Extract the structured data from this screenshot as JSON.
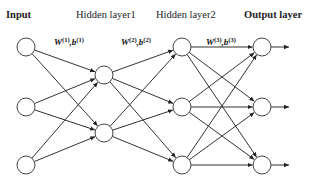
{
  "diagram": {
    "type": "feedforward-neural-network",
    "layers": [
      {
        "id": "input",
        "label": "Input",
        "bold": true,
        "x": 26,
        "nodes_y": [
          47,
          107,
          165
        ]
      },
      {
        "id": "hidden1",
        "label": "Hidden layer1",
        "bold": false,
        "x": 104,
        "nodes_y": [
          75,
          133
        ]
      },
      {
        "id": "hidden2",
        "label": "Hidden layer2",
        "bold": false,
        "x": 182,
        "nodes_y": [
          47,
          107,
          165
        ]
      },
      {
        "id": "output",
        "label": "Output layer",
        "bold": true,
        "x": 262,
        "nodes_y": [
          47,
          107,
          165
        ]
      }
    ],
    "weights": [
      {
        "W": "W",
        "sup_w": "(1)",
        "b": "b",
        "sup_b": "(1)",
        "x": 46,
        "y": 44
      },
      {
        "W": "W",
        "sup_w": "(2)",
        "b": "b",
        "sup_b": "(2)",
        "x": 122,
        "y": 44
      },
      {
        "W": "W",
        "sup_w": "(3)",
        "b": "b",
        "sup_b": "(3)",
        "x": 204,
        "y": 44
      }
    ],
    "node_radius": 9,
    "output_arrow_end_x": 289,
    "colors": {
      "edge": "#333333",
      "node_stroke": "#444444",
      "text": "#222222"
    }
  }
}
